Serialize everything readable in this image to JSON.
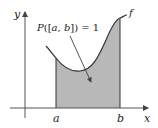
{
  "diagram": {
    "type": "probability-density-area",
    "axes": {
      "x_label": "x",
      "y_label": "y"
    },
    "curve_label": "f",
    "interval": {
      "left_label": "a",
      "right_label": "b"
    },
    "annotation": {
      "P": "P",
      "open": "([",
      "a": "a",
      "comma": ", ",
      "b": "b",
      "close": "])",
      "equals": " = 1"
    },
    "colors": {
      "shaded_region": "#b8b8b8",
      "curve": "#333333",
      "axes": "#555555"
    }
  }
}
